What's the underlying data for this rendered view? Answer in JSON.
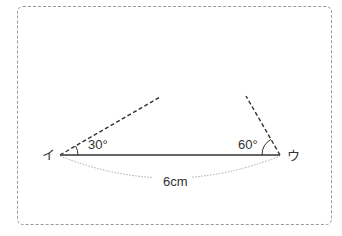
{
  "diagram": {
    "vertex_left": "イ",
    "vertex_right": "ウ",
    "angle_left": "30°",
    "angle_right": "60°",
    "base_length": "6cm"
  },
  "colors": {
    "line": "#333333",
    "frame": "#9a9a9a",
    "dotted": "#aaaaaa"
  }
}
